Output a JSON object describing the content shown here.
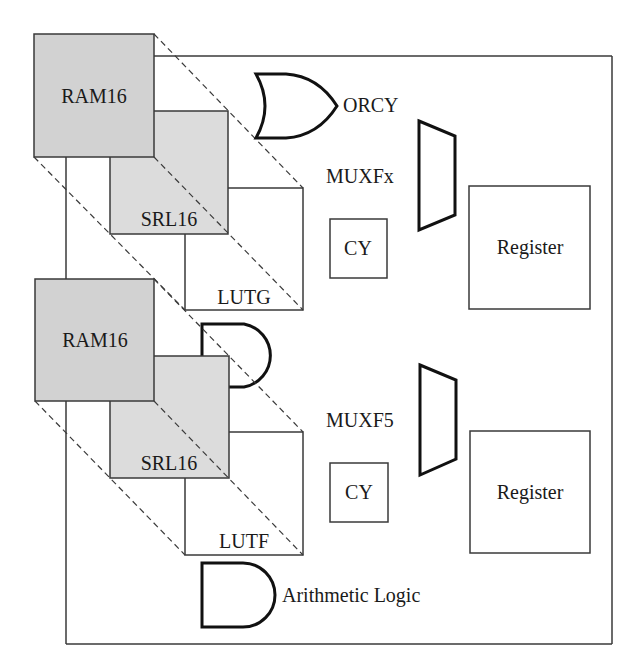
{
  "diagram": {
    "colors": {
      "ram_fill": "#d2d2d2",
      "srl_fill": "#dcdcdc",
      "stroke": "#3a3a3a",
      "gate_stroke": "#111111",
      "background": "#ffffff"
    },
    "upper": {
      "ram_label": "RAM16",
      "srl_label": "SRL16",
      "lut_label": "LUTG",
      "or_gate_label": "ORCY",
      "mux_label": "MUXFx",
      "carry_label": "CY",
      "register_label": "Register"
    },
    "lower": {
      "ram_label": "RAM16",
      "srl_label": "SRL16",
      "lut_label": "LUTF",
      "mux_label": "MUXF5",
      "carry_label": "CY",
      "register_label": "Register",
      "arith_gate_label": "Arithmetic Logic"
    },
    "icons": {
      "or_gate": "or-gate-icon",
      "and_gate": "and-gate-icon",
      "mux": "multiplexer-icon"
    }
  }
}
